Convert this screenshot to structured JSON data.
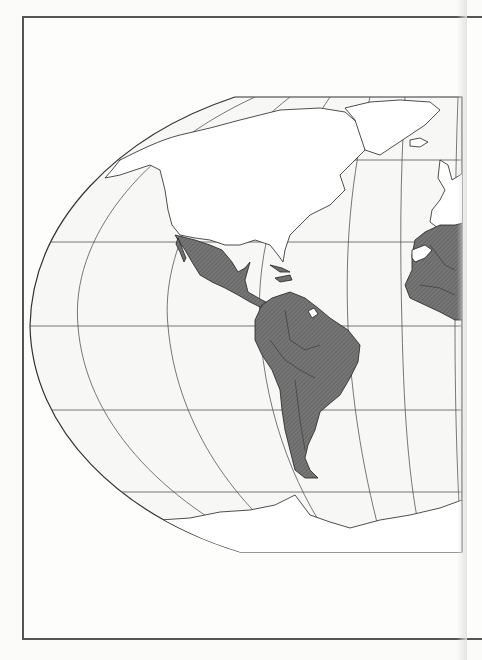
{
  "map": {
    "title": "",
    "projection": "Robinson-like (Western Hemisphere crop)",
    "region_shown": "Americas, Atlantic Ocean, West Africa, Western Europe, Antarctica",
    "highlighted_regions": [
      "Mexico",
      "Central America",
      "Caribbean islands",
      "South America",
      "Africa"
    ],
    "unhighlighted_exceptions": [
      "French Guiana",
      "Western Sahara"
    ],
    "colors": {
      "background": "#fbfbfa",
      "ocean": "#f8f8f7",
      "land": "#ffffff",
      "highlight": "#6e6e6e",
      "outline": "#222222",
      "graticule": "#555555",
      "frame": "#555555"
    },
    "graticule": {
      "parallels_y": [
        97,
        160,
        242,
        326,
        410,
        492,
        552
      ],
      "equator_y": 326
    }
  }
}
